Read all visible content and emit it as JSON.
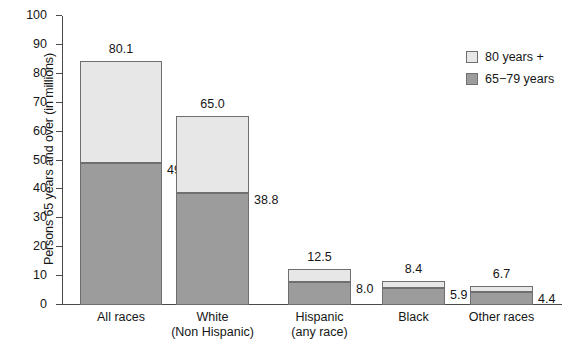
{
  "chart_data": {
    "type": "bar",
    "subtype": "stacked-bar",
    "title": "",
    "xlabel": "",
    "ylabel": "Persons 65 years and over (in millions)",
    "ylim": [
      0,
      100
    ],
    "yticks": [
      0,
      10,
      20,
      30,
      40,
      50,
      60,
      70,
      80,
      90,
      100
    ],
    "ytick_labels": [
      "0",
      "10",
      "20",
      "30",
      "40",
      "50",
      "60",
      "70",
      "80",
      "90",
      "100"
    ],
    "grid": false,
    "legend_position": "top-right",
    "categories": [
      "All races",
      "White\n(Non Hispanic)",
      "Hispanic\n(any race)",
      "Black",
      "Other races"
    ],
    "series": [
      {
        "name": "65−79 years",
        "color": "#9c9c9c",
        "values": [
          49.1,
          38.8,
          8.0,
          5.9,
          4.4
        ]
      },
      {
        "name": "80 years +",
        "color": "#e7e7e7",
        "values": [
          35.4,
          26.7,
          4.5,
          2.5,
          2.3
        ]
      }
    ],
    "total_labels": [
      "80.1",
      "65.0",
      "12.5",
      "8.4",
      "6.7"
    ],
    "lower_segment_labels": [
      "49.1",
      "38.8",
      "8.0",
      "5.9",
      "4.4"
    ],
    "bar_tops": [
      84.5,
      65.5,
      12.5,
      8.4,
      6.7
    ]
  },
  "axis": {
    "y_title": "Persons 65 years and over (in millions)",
    "y_ticks": [
      {
        "value": 100,
        "label": "100"
      },
      {
        "value": 90,
        "label": "90"
      },
      {
        "value": 80,
        "label": "80"
      },
      {
        "value": 70,
        "label": "70"
      },
      {
        "value": 60,
        "label": "60"
      },
      {
        "value": 50,
        "label": "50"
      },
      {
        "value": 40,
        "label": "40"
      },
      {
        "value": 30,
        "label": "30"
      },
      {
        "value": 20,
        "label": "20"
      },
      {
        "value": 10,
        "label": "10"
      },
      {
        "value": 0,
        "label": "0"
      }
    ]
  },
  "bars": [
    {
      "category_line1": "All races",
      "category_line2": "",
      "total_label": "80.1",
      "lower_label": "49.1",
      "lower_value": 49.1,
      "top_value": 84.5,
      "x": 80,
      "width": 82
    },
    {
      "category_line1": "White",
      "category_line2": "(Non Hispanic)",
      "total_label": "65.0",
      "lower_label": "38.8",
      "lower_value": 38.8,
      "top_value": 65.5,
      "x": 176,
      "width": 73
    },
    {
      "category_line1": "Hispanic",
      "category_line2": "(any race)",
      "total_label": "12.5",
      "lower_label": "8.0",
      "lower_value": 8.0,
      "top_value": 12.5,
      "x": 288,
      "width": 63
    },
    {
      "category_line1": "Black",
      "category_line2": "",
      "total_label": "8.4",
      "lower_label": "5.9",
      "lower_value": 5.9,
      "top_value": 8.4,
      "x": 382,
      "width": 63
    },
    {
      "category_line1": "Other races",
      "category_line2": "",
      "total_label": "6.7",
      "lower_label": "4.4",
      "lower_value": 4.4,
      "top_value": 6.7,
      "x": 470,
      "width": 63
    }
  ],
  "legend": {
    "items": [
      {
        "label": "80 years +",
        "color": "#e7e7e7"
      },
      {
        "label": "65−79 years",
        "color": "#9c9c9c"
      }
    ]
  },
  "colors": {
    "upper_segment": "#e7e7e7",
    "lower_segment": "#9c9c9c",
    "bar_border": "#6f6f6f",
    "axis": "#4a4a4a",
    "text": "#161616",
    "background": "#ffffff"
  }
}
